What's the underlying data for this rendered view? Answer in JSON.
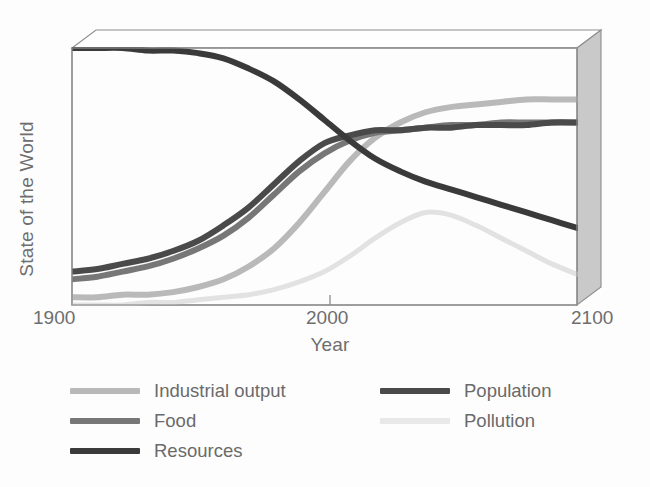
{
  "chart_data": {
    "type": "line",
    "title": "",
    "subtitle": "",
    "xlabel": "Year",
    "ylabel": "State of the World",
    "xlim": [
      1900,
      2100
    ],
    "ylim": [
      0,
      100
    ],
    "xticks": [
      1900,
      2000,
      2100
    ],
    "xticklabels": [
      "1900",
      "2000",
      "2100"
    ],
    "yticks": [],
    "yticklabels": [],
    "grid": false,
    "legend_position": "below-axes",
    "x": [
      1900,
      1910,
      1920,
      1930,
      1940,
      1950,
      1960,
      1970,
      1980,
      1990,
      2000,
      2010,
      2020,
      2030,
      2040,
      2050,
      2060,
      2070,
      2080,
      2090,
      2100
    ],
    "series": [
      {
        "name": "Industrial output",
        "color": "#b9b9b9",
        "values": [
          3,
          3,
          4,
          4,
          5,
          7,
          10,
          15,
          22,
          32,
          44,
          56,
          65,
          71,
          75,
          77,
          78,
          79,
          80,
          80,
          80
        ]
      },
      {
        "name": "Food",
        "color": "#777777",
        "values": [
          10,
          11,
          13,
          15,
          18,
          22,
          27,
          34,
          43,
          52,
          59,
          64,
          67,
          68,
          69,
          70,
          70,
          71,
          71,
          71,
          71
        ]
      },
      {
        "name": "Resources",
        "color": "#3a3a3a",
        "values": [
          100,
          100,
          100,
          99,
          99,
          98,
          96,
          92,
          87,
          80,
          72,
          64,
          57,
          52,
          48,
          45,
          42,
          39,
          36,
          33,
          30
        ]
      },
      {
        "name": "Population",
        "color": "#4a4a4a",
        "values": [
          13,
          14,
          16,
          18,
          21,
          25,
          31,
          38,
          47,
          56,
          63,
          66,
          68,
          68,
          69,
          69,
          70,
          70,
          70,
          71,
          71
        ]
      },
      {
        "name": "Pollution",
        "color": "#e2e2e2",
        "values": [
          0,
          0,
          0,
          1,
          1,
          2,
          3,
          4,
          6,
          9,
          13,
          19,
          26,
          32,
          36,
          35,
          31,
          26,
          21,
          16,
          12
        ]
      }
    ],
    "legend": [
      {
        "label": "Industrial output",
        "color": "#b9b9b9"
      },
      {
        "label": "Food",
        "color": "#777777"
      },
      {
        "label": "Resources",
        "color": "#3a3a3a"
      },
      {
        "label": "Population",
        "color": "#4a4a4a"
      },
      {
        "label": "Pollution",
        "color": "#e8e8e8"
      }
    ],
    "legend_left": [
      "Industrial output",
      "Food",
      "Resources"
    ],
    "legend_right": [
      "Population",
      "Pollution"
    ]
  },
  "axes": {
    "ylabel": "State of the World",
    "xlabel": "Year",
    "tick_start": "1900",
    "tick_mid": "2000",
    "tick_end": "2100"
  },
  "legend": {
    "items": [
      {
        "label": "Industrial output",
        "color": "#b9b9b9"
      },
      {
        "label": "Food",
        "color": "#777777"
      },
      {
        "label": "Resources",
        "color": "#3a3a3a"
      },
      {
        "label": "Population",
        "color": "#4a4a4a"
      },
      {
        "label": "Pollution",
        "color": "#e8e8e8"
      }
    ]
  },
  "colors": {
    "industrial_output": "#b9b9b9",
    "food": "#777777",
    "resources": "#3a3a3a",
    "population": "#4a4a4a",
    "pollution": "#e2e2e2",
    "box_frame": "#888888",
    "box_side": "#c6c6c6",
    "text": "#6e6e6e",
    "background": "#fdfdfd"
  }
}
